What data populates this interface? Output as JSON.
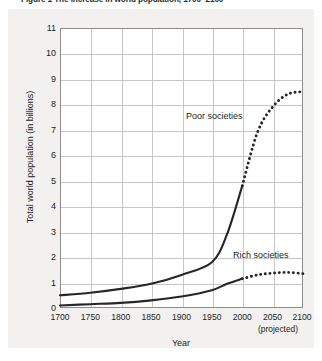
{
  "figure": {
    "title": "Figure 1  The increase in world population, 1700–2100",
    "background_color": "#f2f1ef",
    "plot_background_color": "#ffffff",
    "grid_color": "#c9c7c5",
    "axis_color": "#8d8d8d",
    "curve_color": "#262626"
  },
  "chart_data": {
    "type": "line",
    "title": "Figure 1  The increase in world population, 1700–2100",
    "xlabel": "Year",
    "ylabel": "Total world population (in billions)",
    "xlim": [
      1700,
      2100
    ],
    "ylim": [
      0,
      11
    ],
    "xticks": [
      1700,
      1750,
      1800,
      1850,
      1900,
      1950,
      2000,
      2050,
      2100
    ],
    "yticks": [
      0,
      1,
      2,
      3,
      4,
      5,
      6,
      7,
      8,
      9,
      10,
      11
    ],
    "grid": true,
    "legend": "inline-annotations",
    "annotations": [
      {
        "text": "Poor societies",
        "x": 1910,
        "y": 6.6
      },
      {
        "text": "Rich societies",
        "x": 2018,
        "y": 1.95
      },
      {
        "text": "(projected)",
        "x": 2050,
        "y": -1.2
      }
    ],
    "projection_start_year": 2000,
    "x": [
      1700,
      1750,
      1800,
      1850,
      1900,
      1950,
      1975,
      2000,
      2025,
      2050,
      2075,
      2100
    ],
    "series": [
      {
        "name": "Poor societies",
        "style_solid": "1700-2000",
        "style_dotted": "2000-2100",
        "values": [
          0.5,
          0.6,
          0.75,
          0.95,
          1.3,
          1.8,
          2.9,
          4.8,
          6.9,
          7.9,
          8.4,
          8.5
        ]
      },
      {
        "name": "Rich societies",
        "style_solid": "1700-2000",
        "style_dotted": "2000-2100",
        "values": [
          0.1,
          0.15,
          0.2,
          0.3,
          0.45,
          0.7,
          0.95,
          1.15,
          1.3,
          1.37,
          1.4,
          1.35
        ]
      }
    ]
  },
  "axes": {
    "y_title": "Total world population (in billions)",
    "x_title": "Year",
    "projected_note": "(projected)",
    "y_tick_labels": [
      "11",
      "10",
      "9",
      "8",
      "7",
      "6",
      "5",
      "4",
      "3",
      "2",
      "1",
      "0"
    ],
    "x_tick_labels": [
      "1700",
      "1750",
      "1800",
      "1850",
      "1900",
      "1950",
      "2000",
      "2050",
      "2100"
    ]
  },
  "labels": {
    "poor": "Poor societies",
    "rich": "Rich societies"
  }
}
